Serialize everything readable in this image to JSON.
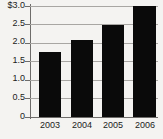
{
  "chart_data": {
    "type": "bar",
    "title": "",
    "subtitle": "",
    "xlabel": "",
    "ylabel": "",
    "categories": [
      "2003",
      "2004",
      "2005",
      "2006"
    ],
    "values": [
      1.77,
      2.08,
      2.5,
      3.0
    ],
    "series": [
      {
        "name": "",
        "values": [
          1.77,
          2.08,
          2.5,
          3.0
        ]
      }
    ],
    "ylim": [
      0,
      3.0
    ],
    "ytick_values": [
      3.0,
      2.5,
      2.0,
      1.5,
      1.0,
      0.5,
      0
    ],
    "ytick_labels": [
      "$3.0",
      "2.5",
      "2.0",
      "1.5",
      "1.0",
      "0.5",
      "0"
    ],
    "grid": true,
    "grid_axis": "y",
    "legend": false,
    "legend_position": "none",
    "annotations": [],
    "colors": {
      "bar": "#0a0a0a",
      "gridline": "#a8a6a3",
      "axis": "#6e6c6a",
      "background": "#f4f3f1",
      "text": "#1b1b1b"
    }
  }
}
